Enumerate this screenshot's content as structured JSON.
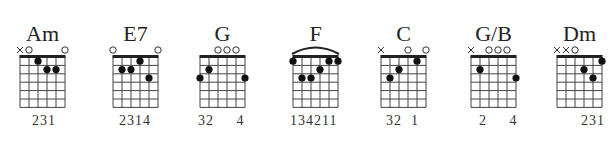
{
  "diagram": {
    "strings": 6,
    "frets_shown": 6,
    "chords": [
      {
        "name": "Am",
        "left": 20,
        "markers": [
          "x",
          "o",
          "",
          "",
          "",
          "o"
        ],
        "dots": [
          [
            4,
            1
          ],
          [
            3,
            2
          ],
          [
            2,
            2
          ]
        ],
        "barre": null,
        "fingering": "231",
        "fingering_offset": 12
      },
      {
        "name": "E7",
        "left": 113,
        "markers": [
          "o",
          "",
          "",
          "",
          "",
          "o"
        ],
        "dots": [
          [
            5,
            2
          ],
          [
            4,
            2
          ],
          [
            3,
            1
          ],
          [
            2,
            3
          ]
        ],
        "barre": null,
        "fingering": "2314",
        "fingering_offset": 6
      },
      {
        "name": "G",
        "left": 200,
        "markers": [
          "",
          "",
          "o",
          "o",
          "o",
          ""
        ],
        "dots": [
          [
            6,
            3
          ],
          [
            5,
            2
          ],
          [
            1,
            3
          ]
        ],
        "barre": null,
        "fingering": "32     4",
        "fingering_offset": -2
      },
      {
        "name": "F",
        "left": 293,
        "markers": [
          "",
          "",
          "",
          "",
          "",
          ""
        ],
        "dots": [
          [
            6,
            1
          ],
          [
            5,
            3
          ],
          [
            4,
            3
          ],
          [
            3,
            2
          ],
          [
            2,
            1
          ],
          [
            1,
            1
          ]
        ],
        "barre": {
          "fret": 1,
          "from": 6,
          "to": 1
        },
        "fingering": "134211",
        "fingering_offset": -3
      },
      {
        "name": "C",
        "left": 381,
        "markers": [
          "x",
          "",
          "",
          "o",
          "",
          "o"
        ],
        "dots": [
          [
            5,
            3
          ],
          [
            4,
            2
          ],
          [
            2,
            1
          ]
        ],
        "barre": null,
        "fingering": "32  1",
        "fingering_offset": 5
      },
      {
        "name": "G/B",
        "left": 471,
        "markers": [
          "x",
          "",
          "o",
          "o",
          "o",
          ""
        ],
        "dots": [
          [
            5,
            2
          ],
          [
            1,
            3
          ]
        ],
        "barre": null,
        "fingering": "2     4",
        "fingering_offset": 8
      },
      {
        "name": "Dm",
        "left": 557,
        "markers": [
          "x",
          "x",
          "o",
          "",
          "",
          ""
        ],
        "dots": [
          [
            3,
            2
          ],
          [
            2,
            3
          ],
          [
            1,
            1
          ]
        ],
        "barre": null,
        "fingering": "231",
        "fingering_offset": 24
      }
    ]
  },
  "style": {
    "line_color": "#444444",
    "dot_color": "#111111",
    "nut_color": "#222222"
  }
}
